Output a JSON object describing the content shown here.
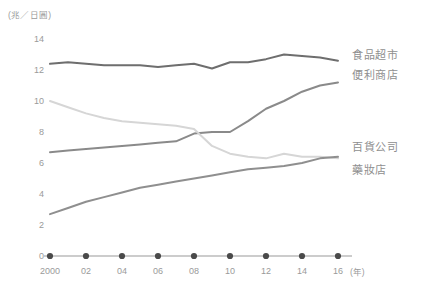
{
  "chart_data": {
    "type": "line",
    "title": "",
    "subtitle": "",
    "xlabel": "(年)",
    "ylabel": "(兆／日圓)",
    "unit_label": "(兆／日圓)",
    "x": [
      2000,
      2001,
      2002,
      2003,
      2004,
      2005,
      2006,
      2007,
      2008,
      2009,
      2010,
      2011,
      2012,
      2013,
      2014,
      2015,
      2016
    ],
    "xtick_labels": [
      "2000",
      "02",
      "04",
      "06",
      "08",
      "10",
      "12",
      "14",
      "16"
    ],
    "xtick_values": [
      2000,
      2002,
      2004,
      2006,
      2008,
      2010,
      2012,
      2014,
      2016
    ],
    "ytick_labels": [
      "0",
      "2",
      "4",
      "6",
      "8",
      "10",
      "12",
      "14"
    ],
    "ytick_values": [
      0,
      2,
      4,
      6,
      8,
      10,
      12,
      14
    ],
    "xlim": [
      2000,
      2016
    ],
    "ylim": [
      0,
      14
    ],
    "grid": false,
    "legend_position": "right-inline",
    "series": [
      {
        "name": "食品超市",
        "label": "食品超市",
        "color": "#6e6e6e",
        "label_value": 12.9,
        "values": [
          12.4,
          12.5,
          12.4,
          12.3,
          12.3,
          12.3,
          12.2,
          12.3,
          12.4,
          12.1,
          12.5,
          12.5,
          12.7,
          13.0,
          12.9,
          12.8,
          12.6
        ]
      },
      {
        "name": "便利商店",
        "label": "便利商店",
        "color": "#8a8a8a",
        "label_value": 11.6,
        "values": [
          6.7,
          6.8,
          6.9,
          7.0,
          7.1,
          7.2,
          7.3,
          7.4,
          7.9,
          8.0,
          8.0,
          8.7,
          9.5,
          10.0,
          10.6,
          11.0,
          11.2
        ]
      },
      {
        "name": "百貨公司",
        "label": "百貨公司",
        "color": "#d6d6d6",
        "label_value": 7.0,
        "values": [
          10.0,
          9.6,
          9.2,
          8.9,
          8.7,
          8.6,
          8.5,
          8.4,
          8.2,
          7.1,
          6.6,
          6.4,
          6.3,
          6.6,
          6.4,
          6.4,
          6.3
        ]
      },
      {
        "name": "藥妝店",
        "label": "藥妝店",
        "color": "#8f8f8f",
        "label_value": 5.5,
        "values": [
          2.7,
          3.1,
          3.5,
          3.8,
          4.1,
          4.4,
          4.6,
          4.8,
          5.0,
          5.2,
          5.4,
          5.6,
          5.7,
          5.8,
          6.0,
          6.3,
          6.4
        ]
      }
    ],
    "axis_color": "#9a9a9a",
    "marker_color": "#4a4a4a"
  }
}
